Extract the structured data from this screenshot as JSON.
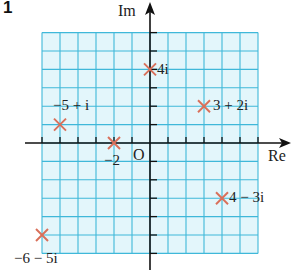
{
  "question_number": "1",
  "axes": {
    "real_label": "Re",
    "imag_label": "Im",
    "origin_label": "O"
  },
  "grid": {
    "x_min": -6,
    "x_max": 6,
    "y_min": -6,
    "y_max": 6,
    "fill_color": "#e3f6fb",
    "line_color": "#3fb8d9",
    "axis_color": "#111111"
  },
  "marker_color": "#d9705a",
  "points": [
    {
      "re": 0,
      "im": 4,
      "label": "4i"
    },
    {
      "re": 3,
      "im": 2,
      "label": "3 + 2i"
    },
    {
      "re": -5,
      "im": 1,
      "label": "−5 + i"
    },
    {
      "re": -2,
      "im": 0,
      "label": "−2"
    },
    {
      "re": 4,
      "im": -3,
      "label": "4 − 3i"
    },
    {
      "re": -6,
      "im": -5,
      "label": "−6 − 5i"
    }
  ]
}
